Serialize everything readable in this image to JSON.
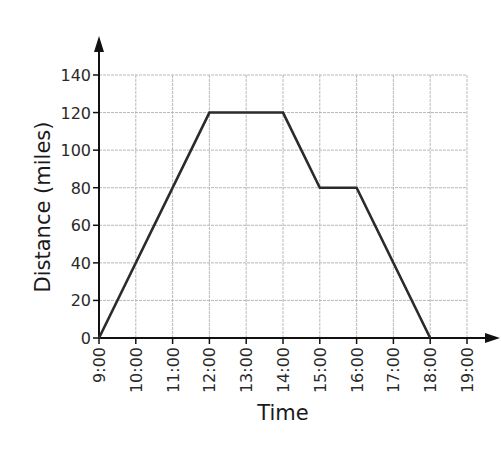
{
  "chart_data": {
    "type": "line",
    "title": "",
    "xlabel": "Time",
    "ylabel": "Distance (miles)",
    "x": [
      "9:00",
      "12:00",
      "14:00",
      "15:00",
      "16:00",
      "18:00"
    ],
    "values": [
      0,
      120,
      120,
      80,
      80,
      0
    ],
    "series": [
      {
        "name": "Distance",
        "x": [
          "9:00",
          "12:00",
          "14:00",
          "15:00",
          "16:00",
          "18:00"
        ],
        "values": [
          0,
          120,
          120,
          80,
          80,
          0
        ]
      }
    ],
    "x_ticks": [
      "9:00",
      "10:00",
      "11:00",
      "12:00",
      "13:00",
      "14:00",
      "15:00",
      "16:00",
      "17:00",
      "18:00",
      "19:00"
    ],
    "y_ticks": [
      0,
      20,
      40,
      60,
      80,
      100,
      120,
      140
    ],
    "ylim": [
      0,
      140
    ],
    "xlim": [
      "9:00",
      "19:00"
    ],
    "grid": true,
    "legend": "none",
    "colors": {
      "line": "#2b2b2b",
      "axis": "#111111",
      "grid": "#b8b8b8"
    }
  }
}
